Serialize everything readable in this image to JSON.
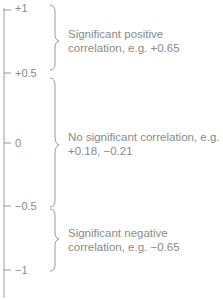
{
  "scale": {
    "ticks": [
      {
        "label": "+1",
        "value": 1
      },
      {
        "label": "+0.5",
        "value": 0.5
      },
      {
        "label": "0",
        "value": 0
      },
      {
        "label": "−0.5",
        "value": -0.5
      },
      {
        "label": "−1",
        "value": -1
      }
    ]
  },
  "ranges": [
    {
      "name": "positive",
      "line1": "Significant positive",
      "line2": "correlation, e.g. +0.65",
      "from": 1,
      "to": 0.5
    },
    {
      "name": "none",
      "line1": "No significant correlation, e.g.",
      "line2": "+0.18, −0.21",
      "from": 0.5,
      "to": -0.5
    },
    {
      "name": "negative",
      "line1": "Significant negative",
      "line2": "correlation, e.g. −0.65",
      "from": -0.5,
      "to": -1
    }
  ],
  "colors": {
    "line": "#9a9a9a",
    "text": "#8a8a8a"
  }
}
